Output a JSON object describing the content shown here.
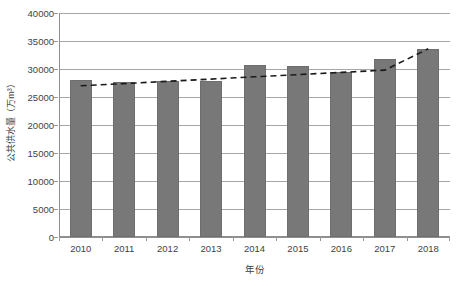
{
  "chart_data": {
    "type": "bar",
    "title": "",
    "xlabel": "年份",
    "ylabel": "公共供水量（万m³）",
    "categories": [
      "2010",
      "2011",
      "2012",
      "2013",
      "2014",
      "2015",
      "2016",
      "2017",
      "2018"
    ],
    "values": [
      28000,
      27700,
      27800,
      27800,
      30700,
      30500,
      29500,
      31700,
      33600
    ],
    "series": [
      {
        "name": "公共供水量",
        "type": "bar",
        "values": [
          28000,
          27700,
          27800,
          27800,
          30700,
          30500,
          29500,
          31700,
          33600
        ]
      },
      {
        "name": "趋势线",
        "type": "line",
        "style": "dashed",
        "values": [
          27000,
          27400,
          27800,
          28200,
          28600,
          29000,
          29400,
          29800,
          33600
        ]
      }
    ],
    "ylim": [
      0,
      40000
    ],
    "ytick_values": [
      0,
      5000,
      10000,
      15000,
      20000,
      25000,
      30000,
      35000,
      40000
    ],
    "ytick_labels": [
      "0",
      "5000",
      "10000",
      "15000",
      "20000",
      "25000",
      "30000",
      "35000",
      "40000"
    ],
    "grid": true,
    "grid_axis": "y",
    "legend": false,
    "legend_position": "none",
    "bar_color": "#787878",
    "trendline_color": "#1a1a1a",
    "gridline_color": "#a6a6a6",
    "axis_color": "#8f8f8f",
    "background_color": "#ffffff"
  }
}
